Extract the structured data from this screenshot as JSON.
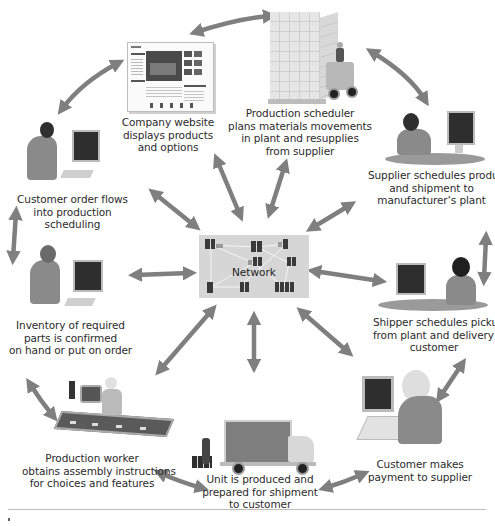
{
  "diagram": {
    "center": {
      "label": "Network"
    },
    "nodes": [
      {
        "id": "company-website",
        "lines": [
          "Company website",
          "displays products",
          "and options"
        ]
      },
      {
        "id": "production-scheduler",
        "lines": [
          "Production scheduler",
          "plans materials movements",
          "in plant and resupplies",
          "from supplier"
        ]
      },
      {
        "id": "supplier",
        "lines": [
          "Supplier schedules production",
          "and shipment to",
          "manufacturer’s plant"
        ]
      },
      {
        "id": "customer-order",
        "lines": [
          "Customer order flows",
          "into production",
          "scheduling"
        ]
      },
      {
        "id": "inventory",
        "lines": [
          "Inventory of required",
          "parts is confirmed",
          "on hand or put on order"
        ]
      },
      {
        "id": "shipper",
        "lines": [
          "Shipper schedules pickup",
          "from plant and delivery to",
          "customer"
        ]
      },
      {
        "id": "production-worker",
        "lines": [
          "Production worker",
          "obtains assembly instructions",
          "for choices and features"
        ]
      },
      {
        "id": "unit-produced",
        "lines": [
          "Unit is produced and",
          "prepared for shipment",
          "to customer"
        ]
      },
      {
        "id": "customer-payment",
        "lines": [
          "Customer makes",
          "payment to supplier"
        ]
      }
    ],
    "colors": {
      "arrow": "#7f7f7f",
      "figure": "#8a8a8a",
      "screen": "#2e2e2e",
      "network_bg": "#d6d6d6"
    }
  }
}
